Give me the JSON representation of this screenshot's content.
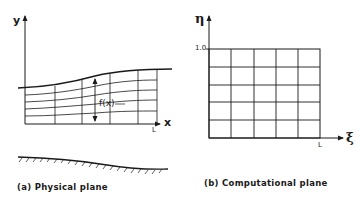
{
  "physical_plane": {
    "caption": "(a) Physical plane",
    "x_axis_label": "x",
    "y_axis_label": "y",
    "length_label": "L",
    "height_function_label": "f(x)"
  },
  "computational_plane": {
    "caption": "(b) Computational plane",
    "xi_axis_label": "ξ",
    "eta_axis_label": "η",
    "eta_max_label": "1.0",
    "length_label": "L",
    "grid_columns": 5,
    "grid_rows": 5
  },
  "colors": {
    "ink": "#1a1a1a",
    "background": "#ffffff"
  }
}
